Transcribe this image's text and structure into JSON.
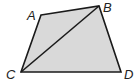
{
  "figure": {
    "type": "quadrilateral",
    "fill_color": "#d9d9d9",
    "stroke_color": "#1a1a1a",
    "vertices": [
      {
        "name": "A",
        "x": 41,
        "y": 15,
        "label_x": 27,
        "label_y": 20
      },
      {
        "name": "B",
        "x": 99,
        "y": 6,
        "label_x": 103,
        "label_y": 12
      },
      {
        "name": "C",
        "x": 21,
        "y": 72,
        "label_x": 6,
        "label_y": 79
      },
      {
        "name": "D",
        "x": 121,
        "y": 72,
        "label_x": 124,
        "label_y": 79
      }
    ],
    "diagonal": [
      "C",
      "B"
    ],
    "labels": {
      "A": "A",
      "B": "B",
      "C": "C",
      "D": "D"
    }
  }
}
